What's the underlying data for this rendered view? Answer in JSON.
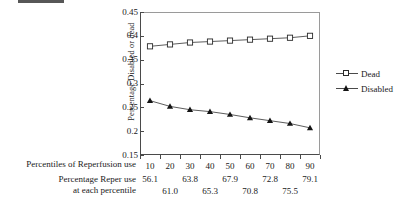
{
  "chart_data": {
    "type": "line",
    "title": "",
    "xlabel": "Percentiles of Reperfusion use",
    "ylabel": "Percentage Disabled or dead",
    "categories": [
      "10",
      "20",
      "30",
      "40",
      "50",
      "60",
      "70",
      "80",
      "90"
    ],
    "ylim": [
      0.15,
      0.45
    ],
    "ytick_labels": [
      "0.45",
      "0.4",
      "0.35",
      "0.3",
      "0.25",
      "0.2",
      "0.15"
    ],
    "ytick_values": [
      0.45,
      0.4,
      0.35,
      0.3,
      0.25,
      0.2,
      0.15
    ],
    "grid": false,
    "legend_position": "right",
    "series": [
      {
        "name": "Dead",
        "marker": "open-square",
        "values": [
          0.378,
          0.382,
          0.386,
          0.388,
          0.39,
          0.392,
          0.394,
          0.396,
          0.4
        ]
      },
      {
        "name": "Disabled",
        "marker": "filled-triangle",
        "values": [
          0.264,
          0.252,
          0.245,
          0.241,
          0.235,
          0.228,
          0.222,
          0.216,
          0.207
        ]
      }
    ],
    "secondary_axis": {
      "caption_line1": "Percentage Reper use",
      "caption_line2": "at each percentile",
      "values": [
        "56.1",
        "61.0",
        "63.8",
        "65.3",
        "67.9",
        "70.8",
        "72.8",
        "75.5",
        "79.1"
      ]
    }
  },
  "axes": {
    "x_caption": "Percentiles of Reperfusion use",
    "y_title": "Percentage Disabled or dead"
  },
  "legend": {
    "items": [
      {
        "label": "Dead"
      },
      {
        "label": "Disabled"
      }
    ]
  },
  "colors": {
    "axis": "#4a4a4a",
    "line": "#4a4a4a",
    "dead_marker_fill": "#ffffff",
    "dead_marker_stroke": "#2a2a2a",
    "disabled_marker": "#141414",
    "background": "#ffffff"
  }
}
